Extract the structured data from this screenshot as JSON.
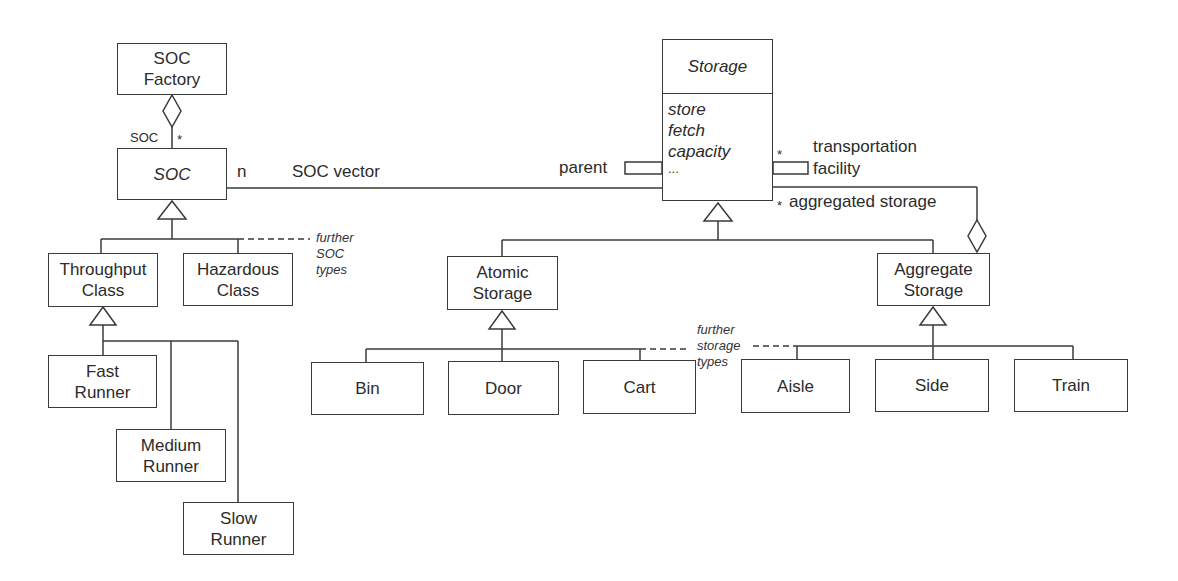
{
  "diagram": {
    "type": "UML class diagram",
    "colors": {
      "line": "#3a3a3a",
      "text": "#2b2b2b",
      "background": "#ffffff"
    }
  },
  "classes": {
    "soc_factory": {
      "name": "SOC\nFactory",
      "line1": "SOC",
      "line2": "Factory"
    },
    "soc": {
      "name": "SOC",
      "abstract": true
    },
    "throughput_class": {
      "line1": "Throughput",
      "line2": "Class"
    },
    "hazardous_class": {
      "line1": "Hazardous",
      "line2": "Class"
    },
    "fast_runner": {
      "line1": "Fast",
      "line2": "Runner"
    },
    "medium_runner": {
      "line1": "Medium",
      "line2": "Runner"
    },
    "slow_runner": {
      "line1": "Slow",
      "line2": "Runner"
    },
    "storage": {
      "name": "Storage",
      "abstract": true,
      "operations": [
        "store",
        "fetch",
        "capacity",
        "..."
      ]
    },
    "atomic_storage": {
      "line1": "Atomic",
      "line2": "Storage"
    },
    "aggregate_storage": {
      "line1": "Aggregate",
      "line2": "Storage"
    },
    "bin": {
      "name": "Bin"
    },
    "door": {
      "name": "Door"
    },
    "cart": {
      "name": "Cart"
    },
    "aisle": {
      "name": "Aisle"
    },
    "side": {
      "name": "Side"
    },
    "train": {
      "name": "Train"
    }
  },
  "associations": {
    "factory_soc": {
      "role": "SOC",
      "multiplicity": "*"
    },
    "soc_vector": {
      "multiplicity": "n",
      "label": "SOC vector"
    },
    "parent": {
      "qualifier": "parent"
    },
    "transportation": {
      "multiplicity": "*",
      "line1": "transportation",
      "line2": "facility"
    },
    "aggregated": {
      "multiplicity": "*",
      "label": "aggregated storage"
    }
  },
  "notes": {
    "further_soc": {
      "line1": "further",
      "line2": "SOC",
      "line3": "types"
    },
    "further_storage": {
      "line1": "further",
      "line2": "storage",
      "line3": "types"
    }
  }
}
